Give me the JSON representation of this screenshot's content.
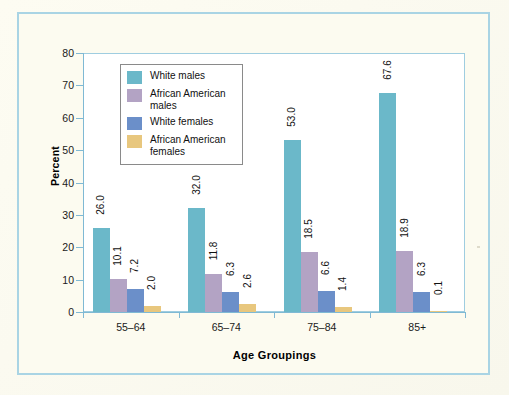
{
  "figure": {
    "background_color": "#fdfcf2",
    "frame_color": "#a9d4e4",
    "plot_background": "#ffffff",
    "plot_border_color": "#9fcde0"
  },
  "chart_data": {
    "type": "bar",
    "title": "",
    "subtitle": "",
    "xlabel": "Age Groupings",
    "ylabel": "Percent",
    "categories": [
      "55–64",
      "65–74",
      "75–84",
      "85+"
    ],
    "ylim": [
      0,
      80
    ],
    "yticks": [
      0,
      10,
      20,
      30,
      40,
      50,
      60,
      70,
      80
    ],
    "ytick_labels": [
      "0",
      "10",
      "20",
      "30",
      "40",
      "50",
      "60",
      "70",
      "80"
    ],
    "grid": false,
    "legend_position": "upper-left-inside",
    "value_labels_rotated": true,
    "series": [
      {
        "name": "White males",
        "color": "#6bb8c9",
        "values": [
          26.0,
          10.1,
          53.0,
          67.6
        ],
        "labels": [
          "26.0",
          "10.1",
          "53.0",
          "67.6"
        ]
      },
      {
        "name": "African American males",
        "color": "#b3a3c4",
        "values": [
          10.1,
          11.8,
          18.5,
          18.9
        ],
        "labels": [
          "10.1",
          "11.8",
          "18.5",
          "18.9"
        ]
      },
      {
        "name": "White females",
        "color": "#6b8fc9",
        "values": [
          7.2,
          6.3,
          6.6,
          6.3
        ],
        "labels": [
          "7.2",
          "6.3",
          "6.6",
          "6.3"
        ]
      },
      {
        "name": "African American females",
        "color": "#e8c77e",
        "values": [
          2.0,
          2.6,
          1.4,
          0.1
        ],
        "labels": [
          "2.0",
          "2.6",
          "1.4",
          "0.1"
        ]
      }
    ],
    "groups": [
      {
        "category": "55–64",
        "bars": [
          {
            "series": "White males",
            "value": 26.0,
            "label": "26.0",
            "color": "#6bb8c9"
          },
          {
            "series": "African American males",
            "value": 10.1,
            "label": "10.1",
            "color": "#b3a3c4"
          },
          {
            "series": "White females",
            "value": 7.2,
            "label": "7.2",
            "color": "#6b8fc9"
          },
          {
            "series": "African American females",
            "value": 2.0,
            "label": "2.0",
            "color": "#e8c77e"
          }
        ]
      },
      {
        "category": "65–74",
        "bars": [
          {
            "series": "White males",
            "value": 32.0,
            "label": "32.0",
            "color": "#6bb8c9"
          },
          {
            "series": "African American males",
            "value": 11.8,
            "label": "11.8",
            "color": "#b3a3c4"
          },
          {
            "series": "White females",
            "value": 6.3,
            "label": "6.3",
            "color": "#6b8fc9"
          },
          {
            "series": "African American females",
            "value": 2.6,
            "label": "2.6",
            "color": "#e8c77e"
          }
        ]
      },
      {
        "category": "75–84",
        "bars": [
          {
            "series": "White males",
            "value": 53.0,
            "label": "53.0",
            "color": "#6bb8c9"
          },
          {
            "series": "African American males",
            "value": 18.5,
            "label": "18.5",
            "color": "#b3a3c4"
          },
          {
            "series": "White females",
            "value": 6.6,
            "label": "6.6",
            "color": "#6b8fc9"
          },
          {
            "series": "African American females",
            "value": 1.4,
            "label": "1.4",
            "color": "#e8c77e"
          }
        ]
      },
      {
        "category": "85+",
        "bars": [
          {
            "series": "White males",
            "value": 67.6,
            "label": "67.6",
            "color": "#6bb8c9"
          },
          {
            "series": "African American males",
            "value": 18.9,
            "label": "18.9",
            "color": "#b3a3c4"
          },
          {
            "series": "White females",
            "value": 6.3,
            "label": "6.3",
            "color": "#6b8fc9"
          },
          {
            "series": "African American females",
            "value": 0.1,
            "label": "0.1",
            "color": "#e8c77e"
          }
        ]
      }
    ]
  },
  "legend": {
    "entries": [
      {
        "label": "White males",
        "color": "#6bb8c9"
      },
      {
        "label": "African American males",
        "color": "#b3a3c4"
      },
      {
        "label": "White females",
        "color": "#6b8fc9"
      },
      {
        "label": "African American females",
        "color": "#e8c77e"
      }
    ]
  }
}
